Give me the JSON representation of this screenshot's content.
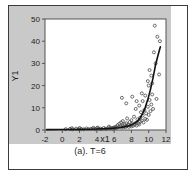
{
  "figure": {
    "caption": "(a). T=6",
    "panel_background": "#c9c9c9",
    "plot_background": "#ffffff",
    "border_color": "#3b3b3b"
  },
  "chart_data": {
    "type": "scatter",
    "title": "",
    "xlabel": "x1",
    "ylabel": "Y1",
    "xlim": [
      -2,
      12
    ],
    "ylim": [
      0,
      50
    ],
    "xticks": [
      -2,
      0,
      2,
      4,
      6,
      8,
      10,
      12
    ],
    "yticks": [
      0,
      10,
      20,
      30,
      40,
      50
    ],
    "grid": false,
    "legend": null,
    "marker": "open-circle",
    "marker_color": "#4a4a4a",
    "series": [
      {
        "name": "observations",
        "type": "scatter",
        "points": [
          [
            0.4,
            0.4
          ],
          [
            0.9,
            0.5
          ],
          [
            1.2,
            0.3
          ],
          [
            1.6,
            0.6
          ],
          [
            1.9,
            0.4
          ],
          [
            2.2,
            0.5
          ],
          [
            2.5,
            0.3
          ],
          [
            2.8,
            0.7
          ],
          [
            3.0,
            0.4
          ],
          [
            3.3,
            0.5
          ],
          [
            3.5,
            0.6
          ],
          [
            3.8,
            0.4
          ],
          [
            4.0,
            0.8
          ],
          [
            4.2,
            0.5
          ],
          [
            4.4,
            0.6
          ],
          [
            4.6,
            0.4
          ],
          [
            4.8,
            0.9
          ],
          [
            5.0,
            0.6
          ],
          [
            5.1,
            0.5
          ],
          [
            5.3,
            0.8
          ],
          [
            5.5,
            0.7
          ],
          [
            5.6,
            1.0
          ],
          [
            5.8,
            0.6
          ],
          [
            5.9,
            0.9
          ],
          [
            6.0,
            1.2
          ],
          [
            6.1,
            0.8
          ],
          [
            6.2,
            1.4
          ],
          [
            6.3,
            1.0
          ],
          [
            6.4,
            2.2
          ],
          [
            6.5,
            1.3
          ],
          [
            6.6,
            2.8
          ],
          [
            6.7,
            1.6
          ],
          [
            6.8,
            3.4
          ],
          [
            6.9,
            1.1
          ],
          [
            7.0,
            2.0
          ],
          [
            7.0,
            4.0
          ],
          [
            7.1,
            1.5
          ],
          [
            7.2,
            2.6
          ],
          [
            7.3,
            1.2
          ],
          [
            7.4,
            3.0
          ],
          [
            7.5,
            1.8
          ],
          [
            7.5,
            5.2
          ],
          [
            7.6,
            2.3
          ],
          [
            7.7,
            1.4
          ],
          [
            7.8,
            3.6
          ],
          [
            7.9,
            2.1
          ],
          [
            8.0,
            1.6
          ],
          [
            8.0,
            4.4
          ],
          [
            8.1,
            2.9
          ],
          [
            8.2,
            1.9
          ],
          [
            8.3,
            6.0
          ],
          [
            8.4,
            2.4
          ],
          [
            8.5,
            3.2
          ],
          [
            8.5,
            9.5
          ],
          [
            8.6,
            2.0
          ],
          [
            8.7,
            4.8
          ],
          [
            8.8,
            3.0
          ],
          [
            8.9,
            11.0
          ],
          [
            8.9,
            2.5
          ],
          [
            9.0,
            5.5
          ],
          [
            9.0,
            3.8
          ],
          [
            9.1,
            8.0
          ],
          [
            9.2,
            4.2
          ],
          [
            9.3,
            13.0
          ],
          [
            9.3,
            6.5
          ],
          [
            9.4,
            3.4
          ],
          [
            9.5,
            9.0
          ],
          [
            9.6,
            5.0
          ],
          [
            9.6,
            15.5
          ],
          [
            9.7,
            7.5
          ],
          [
            9.8,
            4.6
          ],
          [
            9.9,
            10.5
          ],
          [
            10.0,
            20.0
          ],
          [
            10.0,
            6.8
          ],
          [
            10.1,
            13.5
          ],
          [
            10.2,
            8.5
          ],
          [
            10.3,
            24.5
          ],
          [
            10.3,
            11.5
          ],
          [
            10.4,
            16.0
          ],
          [
            10.5,
            9.5
          ],
          [
            10.6,
            35.0
          ],
          [
            10.7,
            47.0
          ],
          [
            10.8,
            30.0
          ],
          [
            10.9,
            14.0
          ],
          [
            11.0,
            42.0
          ],
          [
            11.2,
            25.0
          ],
          [
            11.3,
            40.0
          ],
          [
            6.9,
            14.5
          ],
          [
            7.4,
            12.0
          ],
          [
            8.1,
            15.0
          ],
          [
            8.6,
            13.0
          ],
          [
            9.2,
            16.5
          ],
          [
            9.9,
            22.0
          ],
          [
            10.1,
            27.0
          ],
          [
            10.4,
            21.0
          ],
          [
            5.4,
            1.5
          ],
          [
            4.1,
            1.1
          ],
          [
            2.0,
            0.9
          ],
          [
            3.6,
            1.0
          ],
          [
            1.1,
            0.8
          ]
        ]
      },
      {
        "name": "fitted-curve",
        "type": "line",
        "color": "#121212",
        "points": [
          [
            -1.8,
            0.15
          ],
          [
            0.0,
            0.2
          ],
          [
            2.0,
            0.3
          ],
          [
            4.0,
            0.45
          ],
          [
            5.5,
            0.7
          ],
          [
            6.5,
            1.0
          ],
          [
            7.2,
            1.4
          ],
          [
            7.8,
            2.0
          ],
          [
            8.3,
            2.9
          ],
          [
            8.7,
            4.0
          ],
          [
            9.0,
            5.4
          ],
          [
            9.3,
            7.4
          ],
          [
            9.6,
            10.2
          ],
          [
            9.9,
            13.8
          ],
          [
            10.2,
            18.2
          ],
          [
            10.5,
            23.5
          ],
          [
            10.8,
            29.5
          ],
          [
            11.1,
            34.0
          ],
          [
            11.35,
            37.5
          ]
        ]
      }
    ]
  }
}
